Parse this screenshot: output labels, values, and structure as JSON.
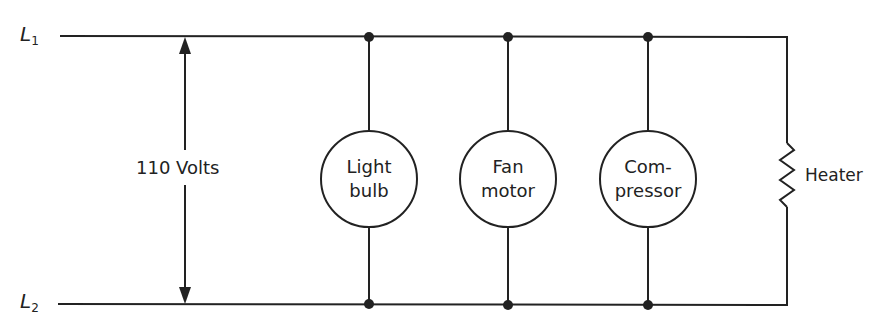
{
  "diagram": {
    "type": "parallel-circuit",
    "lines": {
      "l1": {
        "label": "L",
        "sub": "1"
      },
      "l2": {
        "label": "L",
        "sub": "2"
      }
    },
    "voltage_label": "110 Volts",
    "loads": [
      {
        "line1": "Light",
        "line2": "bulb"
      },
      {
        "line1": "Fan",
        "line2": "motor"
      },
      {
        "line1": "Com-",
        "line2": "pressor"
      }
    ],
    "heater_label": "Heater",
    "colors": {
      "stroke": "#222222",
      "background": "#ffffff"
    }
  }
}
